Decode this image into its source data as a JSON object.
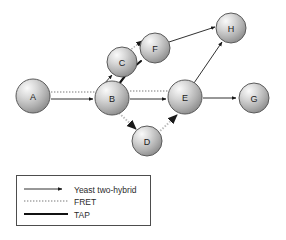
{
  "figure": {
    "background": "#ffffff",
    "node_fill_light": "#f2f2f2",
    "node_fill_mid": "#b9b9b9",
    "node_fill_dark": "#8f8f8f",
    "node_stroke": "#555555",
    "edge_color_y2h": "#1a1a1a",
    "edge_color_fret": "#9a9a9a",
    "edge_color_tap": "#111111",
    "legend_border": "#4d4d4d"
  },
  "graph": {
    "type": "node-link-diagram",
    "nodes": [
      {
        "id": "A",
        "label": "A",
        "cx": 33,
        "cy": 96,
        "r": 17
      },
      {
        "id": "B",
        "label": "B",
        "cx": 112,
        "cy": 98,
        "r": 17
      },
      {
        "id": "C",
        "label": "C",
        "cx": 122,
        "cy": 62,
        "r": 15
      },
      {
        "id": "F",
        "label": "F",
        "cx": 155,
        "cy": 48,
        "r": 15
      },
      {
        "id": "D",
        "label": "D",
        "cx": 147,
        "cy": 141,
        "r": 15
      },
      {
        "id": "E",
        "label": "E",
        "cx": 185,
        "cy": 97,
        "r": 17
      },
      {
        "id": "H",
        "label": "H",
        "cx": 231,
        "cy": 28,
        "r": 15
      },
      {
        "id": "G",
        "label": "G",
        "cx": 254,
        "cy": 98,
        "r": 15
      }
    ],
    "edges": [
      {
        "source": "A",
        "target": "B",
        "type": "FRET",
        "arrow": false
      },
      {
        "source": "A",
        "target": "B",
        "type": "Yeast two-hybrid",
        "arrow": true
      },
      {
        "source": "B",
        "target": "C",
        "type": "Yeast two-hybrid",
        "arrow": true
      },
      {
        "source": "C",
        "target": "F",
        "type": "FRET",
        "arrow": true
      },
      {
        "source": "B",
        "target": "F",
        "type": "TAP",
        "arrow": false
      },
      {
        "source": "F",
        "target": "H",
        "type": "Yeast two-hybrid",
        "arrow": true
      },
      {
        "source": "B",
        "target": "E",
        "type": "FRET",
        "arrow": false
      },
      {
        "source": "B",
        "target": "E",
        "type": "Yeast two-hybrid",
        "arrow": true
      },
      {
        "source": "B",
        "target": "D",
        "type": "FRET",
        "arrow": true
      },
      {
        "source": "D",
        "target": "E",
        "type": "FRET",
        "arrow": true
      },
      {
        "source": "E",
        "target": "H",
        "type": "Yeast two-hybrid",
        "arrow": true
      },
      {
        "source": "E",
        "target": "G",
        "type": "Yeast two-hybrid",
        "arrow": true
      }
    ]
  },
  "legend": {
    "box": {
      "x": 16,
      "y": 175,
      "width": 134,
      "height": 50
    },
    "items": [
      {
        "label": "Yeast two-hybrid",
        "style": "solid-thin-arrow"
      },
      {
        "label": "FRET",
        "style": "dotted-thin"
      },
      {
        "label": "TAP",
        "style": "solid-thick"
      }
    ]
  }
}
